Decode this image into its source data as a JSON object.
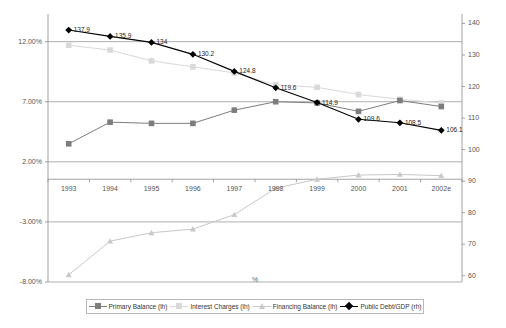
{
  "chart_data": {
    "type": "line",
    "title": "",
    "xlabel": "%",
    "ylabel": "",
    "categories": [
      "1993",
      "1994",
      "1995",
      "1996",
      "1997",
      "1998",
      "1999",
      "2000",
      "2001",
      "2002e"
    ],
    "left_axis": {
      "ticks": [
        "12.00%",
        "7.00%",
        "2.00%",
        "-3.00%",
        "-8.00%"
      ],
      "values": [
        12.0,
        7.0,
        2.0,
        -3.0,
        -8.0
      ],
      "ylim": [
        -8.0,
        14.3
      ]
    },
    "right_axis": {
      "ticks": [
        "140",
        "130",
        "120",
        "110",
        "100",
        "90",
        "80",
        "70",
        "60"
      ],
      "values": [
        140,
        130,
        120,
        110,
        100,
        90,
        80,
        70,
        60
      ],
      "ylim": [
        58,
        143
      ]
    },
    "grid": true,
    "legend_position": "bottom",
    "series": [
      {
        "name": "Primary Balance (lh)",
        "axis": "left",
        "color": "#7d7d7d",
        "marker": "square",
        "values": [
          3.5,
          5.3,
          5.2,
          5.2,
          6.3,
          7.0,
          6.9,
          6.2,
          7.1,
          6.6
        ],
        "labels": [
          "",
          "",
          "",
          "",
          "",
          "",
          "",
          "",
          "",
          ""
        ]
      },
      {
        "name": "Interest Charges (lh)",
        "axis": "left",
        "color": "#d9d9d9",
        "marker": "square",
        "values": [
          11.7,
          11.3,
          10.4,
          9.9,
          9.4,
          8.4,
          8.2,
          7.6,
          7.2,
          6.9
        ],
        "labels": [
          "",
          "",
          "",
          "",
          "",
          "",
          "",
          "",
          "",
          ""
        ]
      },
      {
        "name": "Financing Balance (lh)",
        "axis": "left",
        "color": "#c8c8c8",
        "marker": "triangle",
        "values": [
          -7.4,
          -4.6,
          -3.9,
          -3.6,
          -2.4,
          -0.2,
          0.55,
          0.9,
          0.95,
          0.85
        ],
        "labels": [
          "",
          "",
          "",
          "",
          "",
          "",
          "",
          "",
          "",
          ""
        ]
      },
      {
        "name": "Public Debt/GDP (rh)",
        "axis": "right",
        "color": "#000000",
        "marker": "diamond",
        "values": [
          137.9,
          135.9,
          134.0,
          130.2,
          124.8,
          119.6,
          114.9,
          109.6,
          108.5,
          106.1
        ],
        "labels": [
          "137.9",
          "135.9",
          "134",
          "130.2",
          "124.8",
          "119.6",
          "114.9",
          "109.6",
          "108.5",
          "106.1"
        ]
      }
    ]
  },
  "legend": {
    "items": [
      {
        "label": "Primary Balance (lh)"
      },
      {
        "label": "Interest Charges (lh)"
      },
      {
        "label": "Financing Balance (lh)"
      },
      {
        "label": "Public Debt/GDP (rh)"
      }
    ]
  },
  "axis_caption": "%"
}
